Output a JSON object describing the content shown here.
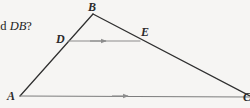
{
  "figure": {
    "background_color": "#f6f5f3",
    "question_fragment": {
      "lead": "nd ",
      "segment": "DB",
      "tail": "?"
    },
    "labels": {
      "B": "B",
      "D": "D",
      "E": "E",
      "A": "A",
      "C": "C"
    },
    "colors": {
      "outline": "#2f2f2f",
      "marker": "#8c8c8c",
      "text": "#242424"
    },
    "geometry": {
      "vertices": {
        "A": [
          20,
          96
        ],
        "B": [
          93,
          14
        ],
        "C": [
          252,
          97
        ]
      },
      "midsegment": {
        "D": [
          68,
          41
        ],
        "E": [
          140,
          41
        ]
      },
      "parallel_marks": [
        {
          "on": "DE",
          "at": [
            104,
            41
          ],
          "direction": "right"
        },
        {
          "on": "AC",
          "at": [
            126,
            96
          ],
          "direction": "right"
        }
      ]
    }
  }
}
